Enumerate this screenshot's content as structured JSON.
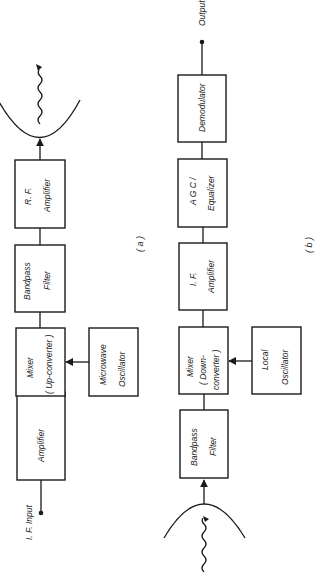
{
  "diagram_a": {
    "caption": "( a )",
    "input_label": "I. F.  Input",
    "blocks": [
      {
        "id": "amplifier",
        "line1": "Amplifier",
        "line2": ""
      },
      {
        "id": "mixer",
        "line1": "Mixer",
        "line2": "( Up-converter )"
      },
      {
        "id": "bandpass-filter",
        "line1": "Bandpass",
        "line2": "Filter"
      },
      {
        "id": "rf-amplifier",
        "line1": "R. F.",
        "line2": "Amplifier"
      },
      {
        "id": "microwave-oscillator",
        "line1": "Microwave",
        "line2": "Oscillator"
      }
    ],
    "antenna": "transmit-antenna-dish"
  },
  "diagram_b": {
    "caption": "( b )",
    "output_label": "Output",
    "blocks": [
      {
        "id": "bandpass-filter",
        "line1": "Bandpass",
        "line2": "Filter"
      },
      {
        "id": "mixer",
        "line1": "Mixer",
        "line2": "( Down-",
        "line3": "converter )"
      },
      {
        "id": "if-amplifier",
        "line1": "I. F.",
        "line2": "Amplifier"
      },
      {
        "id": "agc-equalizer",
        "line1": "A G C /",
        "line2": "Equalizer"
      },
      {
        "id": "demodulator",
        "line1": "Demodulator",
        "line2": ""
      },
      {
        "id": "local-oscillator",
        "line1": "Local",
        "line2": "Oscillator"
      }
    ],
    "antenna": "receive-antenna-dish"
  }
}
